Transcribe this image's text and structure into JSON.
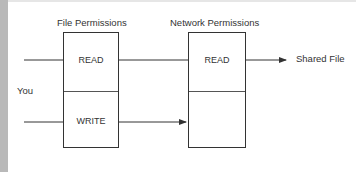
{
  "diagram": {
    "file_permissions": {
      "title": "File Permissions",
      "cells": [
        "READ",
        "WRITE"
      ]
    },
    "network_permissions": {
      "title": "Network Permissions",
      "cells": [
        "READ",
        ""
      ]
    },
    "source_label": "You",
    "target_label": "Shared File",
    "colors": {
      "line": "#333333",
      "background": "#ffffff",
      "margin": "#b9b9b9"
    }
  }
}
